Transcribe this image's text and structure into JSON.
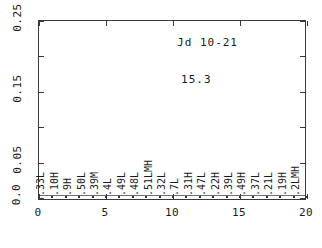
{
  "chart_data": {
    "type": "scatter",
    "title": "Jd 10-21",
    "annotation": "15.3",
    "xlabel": "",
    "ylabel": "",
    "xlim": [
      0,
      20
    ],
    "ylim": [
      0.0,
      0.25
    ],
    "grid": false,
    "legend": null,
    "x_ticks": [
      "0",
      "5",
      "10",
      "15",
      "20"
    ],
    "x_tick_values": [
      0,
      5,
      10,
      15,
      20
    ],
    "y_ticks": [
      "0.0",
      "0.05",
      "0.15",
      "0.25"
    ],
    "y_tick_values": [
      0.0,
      0.05,
      0.15,
      0.25
    ],
    "y_minor_tick_values": [
      0.1,
      0.2
    ],
    "point_labels": [
      ".33L",
      ".10H",
      ".9H",
      ".50L",
      ".39M",
      ".4L",
      ".49L",
      ".48L",
      ".51LMH",
      ".32L",
      ".7L",
      ".31H",
      ".47L",
      ".22H",
      ".39L",
      ".49H",
      ".37L",
      ".21L",
      ".19H",
      ".2LMH"
    ],
    "x": [
      1,
      2,
      3,
      4,
      5,
      6,
      7,
      8,
      9,
      10,
      11,
      12,
      13,
      14,
      15,
      16,
      17,
      18,
      19,
      20
    ],
    "values": [
      0.001,
      0.001,
      0.001,
      0.001,
      0.001,
      0.001,
      0.001,
      0.001,
      0.001,
      0.001,
      0.001,
      0.001,
      0.001,
      0.001,
      0.001,
      0.001,
      0.001,
      0.001,
      0.001,
      0.001
    ],
    "points": [
      {
        "x": 1,
        "y": 0.001,
        "label": ".33L",
        "label_height": 0.148
      },
      {
        "x": 2,
        "y": 0.001,
        "label": ".10H",
        "label_height": 0.06
      },
      {
        "x": 3,
        "y": 0.001,
        "label": ".9H",
        "label_height": 0.052
      },
      {
        "x": 4,
        "y": 0.001,
        "label": ".50L",
        "label_height": 0.048
      },
      {
        "x": 5,
        "y": 0.001,
        "label": ".39M",
        "label_height": 0.048
      },
      {
        "x": 6,
        "y": 0.001,
        "label": ".4L",
        "label_height": 0.04
      },
      {
        "x": 7,
        "y": 0.001,
        "label": ".49L",
        "label_height": 0.044
      },
      {
        "x": 8,
        "y": 0.001,
        "label": ".48L",
        "label_height": 0.046
      },
      {
        "x": 9,
        "y": 0.001,
        "label": ".51LMH",
        "label_height": 0.062
      },
      {
        "x": 10,
        "y": 0.001,
        "label": ".32L",
        "label_height": 0.046
      },
      {
        "x": 11,
        "y": 0.001,
        "label": ".7L",
        "label_height": 0.038
      },
      {
        "x": 12,
        "y": 0.001,
        "label": ".31H",
        "label_height": 0.046
      },
      {
        "x": 13,
        "y": 0.001,
        "label": ".47L",
        "label_height": 0.046
      },
      {
        "x": 14,
        "y": 0.001,
        "label": ".22H",
        "label_height": 0.046
      },
      {
        "x": 15,
        "y": 0.001,
        "label": ".39L",
        "label_height": 0.046
      },
      {
        "x": 16,
        "y": 0.001,
        "label": ".49H",
        "label_height": 0.046
      },
      {
        "x": 17,
        "y": 0.001,
        "label": ".37L",
        "label_height": 0.046
      },
      {
        "x": 18,
        "y": 0.001,
        "label": ".21L",
        "label_height": 0.044
      },
      {
        "x": 19,
        "y": 0.001,
        "label": ".19H",
        "label_height": 0.046
      },
      {
        "x": 20,
        "y": 0.001,
        "label": ".2LMH",
        "label_height": 0.056
      }
    ]
  },
  "colors": {
    "axis": "#3a3a3a",
    "text": "#1a1a1a",
    "marker": "#333333",
    "background": "#ffffff"
  }
}
